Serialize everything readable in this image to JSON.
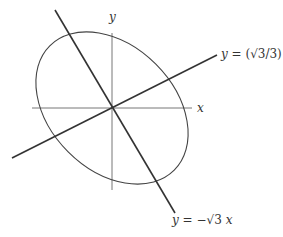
{
  "diagram": {
    "type": "rotated-ellipse-with-axes",
    "colors": {
      "background": "#ffffff",
      "axis": "#777777",
      "ellipse": "#444444",
      "lines": "#333333",
      "text": "#333333"
    },
    "axes": {
      "x_label": "x",
      "y_label": "y"
    },
    "lines": [
      {
        "name": "shallow-line",
        "label": "y = (√3/3) x",
        "label_prefix": "y",
        "label_eq": " = (√3/3) ",
        "label_suffix": "x",
        "slope_deg": 30
      },
      {
        "name": "steep-line",
        "label": "y = −√3 x",
        "label_prefix": "y",
        "label_eq": " = −√3 ",
        "label_suffix": "x",
        "slope_deg": -60
      }
    ],
    "ellipse": {
      "center": [
        112,
        108
      ],
      "semi_major": 88,
      "semi_minor": 62,
      "rotation_deg": 45
    }
  }
}
